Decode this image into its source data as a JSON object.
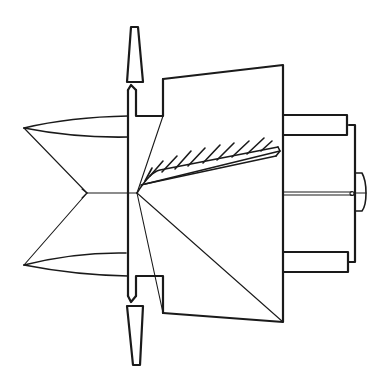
{
  "figure": {
    "kind": "technical line drawing",
    "colors": {
      "background": "#ffffff",
      "ink": "#1a1a1a"
    },
    "parts": [
      {
        "id": "nose-cone",
        "label": "nose cone (double-cone)"
      },
      {
        "id": "flange-plate",
        "label": "central flange plate"
      },
      {
        "id": "blade-top",
        "label": "upper radial blade"
      },
      {
        "id": "blade-bottom",
        "label": "lower radial blade"
      },
      {
        "id": "housing",
        "label": "trapezoidal housing"
      },
      {
        "id": "hatched-vane",
        "label": "hatched inclined vane"
      },
      {
        "id": "hub-upper-boss",
        "label": "upper hub boss"
      },
      {
        "id": "hub-lower-boss",
        "label": "lower hub boss"
      },
      {
        "id": "end-plate",
        "label": "end plate"
      },
      {
        "id": "axle-cap",
        "label": "axle cap"
      },
      {
        "id": "shaft",
        "label": "central shaft"
      }
    ]
  }
}
